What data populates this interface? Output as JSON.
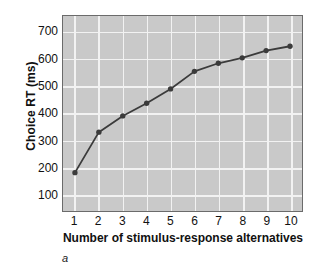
{
  "figure": {
    "panel_label": "a",
    "background_color": "#ffffff",
    "plot_background_color": "#c9c9c9",
    "gridline_color": "#f2f2f2",
    "axis_border_color": "#6b6b6b",
    "series_color": "#3b3b3b"
  },
  "chart_data": {
    "type": "line",
    "title": "",
    "subtitle": "",
    "xlabel": "Number of stimulus-response alternatives",
    "ylabel": "Choice RT (ms)",
    "categories": [
      1,
      2,
      3,
      4,
      5,
      6,
      7,
      8,
      9,
      10
    ],
    "xtick_labels": [
      "1",
      "2",
      "3",
      "4",
      "5",
      "6",
      "7",
      "8",
      "9",
      "10"
    ],
    "ytick_labels": [
      "100",
      "200",
      "300",
      "400",
      "500",
      "600",
      "700"
    ],
    "yticks": [
      100,
      200,
      300,
      400,
      500,
      600,
      700
    ],
    "values": [
      180,
      330,
      390,
      437,
      490,
      555,
      585,
      605,
      632,
      648
    ],
    "series": [
      {
        "name": "Choice RT",
        "values": [
          180,
          330,
          390,
          437,
          490,
          555,
          585,
          605,
          632,
          648
        ]
      }
    ],
    "xlim": [
      0.5,
      10.5
    ],
    "ylim": [
      38,
      760
    ],
    "grid": true,
    "legend": false,
    "legend_position": "none",
    "marker": "circle",
    "annotations": []
  }
}
